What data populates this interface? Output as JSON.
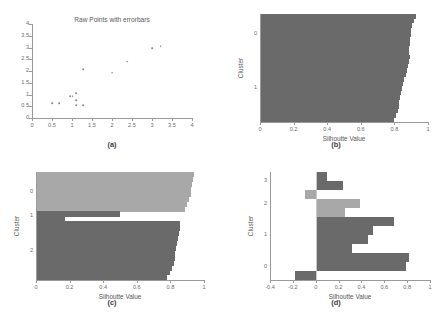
{
  "figure": {
    "panels": [
      "a",
      "b",
      "c",
      "d"
    ],
    "colors": {
      "dark_gray": "#6a6a6a",
      "light_gray": "#a8a8a8",
      "axis": "#9a9a9a",
      "text": "#5a5a5a",
      "background": "#ffffff"
    }
  },
  "panel_a": {
    "label": "(a)",
    "chart_data": {
      "type": "scatter",
      "title": "Raw Points with errorbars",
      "xlabel": "",
      "ylabel": "",
      "xlim": [
        0,
        4
      ],
      "ylim": [
        0,
        4
      ],
      "xticks": [
        "0",
        "0.5",
        "1",
        "1.5",
        "2",
        "2.5",
        "3",
        "3.5",
        "4"
      ],
      "xtick_values": [
        0,
        0.5,
        1,
        1.5,
        2,
        2.5,
        3,
        3.5,
        4
      ],
      "yticks": [
        "0",
        "0.5",
        "1",
        "1.5",
        "2",
        "2.5",
        "3",
        "3.5",
        "4"
      ],
      "ytick_values": [
        0,
        0.5,
        1,
        1.5,
        2,
        2.5,
        3,
        3.5,
        4
      ],
      "grid": false,
      "points": [
        {
          "x": 0.5,
          "y": 0.62
        },
        {
          "x": 0.68,
          "y": 0.62
        },
        {
          "x": 0.95,
          "y": 0.93
        },
        {
          "x": 1.02,
          "y": 0.93
        },
        {
          "x": 1.1,
          "y": 1.05
        },
        {
          "x": 1.1,
          "y": 0.75
        },
        {
          "x": 1.1,
          "y": 0.55
        },
        {
          "x": 1.28,
          "y": 0.55
        },
        {
          "x": 1.28,
          "y": 2.08
        },
        {
          "x": 2.0,
          "y": 1.93
        },
        {
          "x": 2.38,
          "y": 2.4
        },
        {
          "x": 3.0,
          "y": 2.97
        },
        {
          "x": 3.22,
          "y": 3.05
        }
      ]
    }
  },
  "panel_b": {
    "label": "(b)",
    "chart_data": {
      "type": "bar",
      "orientation": "horizontal",
      "title": "",
      "xlabel": "Silhoutte Value",
      "ylabel": "Cluster",
      "xlim": [
        0,
        1
      ],
      "xticks": [
        "0",
        "0.2",
        "0.4",
        "0.6",
        "0.8",
        "1"
      ],
      "xtick_values": [
        0,
        0.2,
        0.4,
        0.6,
        0.8,
        1
      ],
      "cluster_labels": [
        "0",
        "1"
      ],
      "cluster_label_positions": [
        0.8,
        0.35
      ],
      "grid": false,
      "clusters": [
        {
          "name": "0",
          "color": "#6a6a6a",
          "values": [
            0.93,
            0.915,
            0.905,
            0.9,
            0.9,
            0.895,
            0.89,
            0.885,
            0.885
          ],
          "starts": [
            0,
            0,
            0,
            0,
            0,
            0,
            0,
            0,
            0
          ]
        },
        {
          "name": "1",
          "color": "#6a6a6a",
          "values": [
            0.89,
            0.885,
            0.88,
            0.875,
            0.87,
            0.86,
            0.85,
            0.845,
            0.84,
            0.835,
            0.83,
            0.825,
            0.82,
            0.81,
            0.8
          ],
          "starts": [
            0,
            0,
            0,
            0,
            0,
            0,
            0,
            0,
            0,
            0,
            0,
            0,
            0,
            0,
            0
          ],
          "offset_start": 0.4
        }
      ]
    }
  },
  "panel_c": {
    "label": "(c)",
    "chart_data": {
      "type": "bar",
      "orientation": "horizontal",
      "title": "",
      "xlabel": "Silhoutte Value",
      "ylabel": "Cluster",
      "xlim": [
        0,
        1
      ],
      "xticks": [
        "0",
        "0.2",
        "0.4",
        "0.6",
        "0.8",
        "1"
      ],
      "xtick_values": [
        0,
        0.2,
        0.4,
        0.6,
        0.8,
        1
      ],
      "cluster_labels": [
        "0",
        "1",
        "2"
      ],
      "grid": false,
      "clusters": [
        {
          "name": "0",
          "color": "#a8a8a8",
          "values": [
            0.94,
            0.935,
            0.93,
            0.925,
            0.92,
            0.91,
            0.9,
            0.885
          ]
        },
        {
          "name": "1",
          "color": "#6a6a6a",
          "values": [
            0.5,
            0.17
          ]
        },
        {
          "name": "2",
          "color": "#6a6a6a",
          "values": [
            0.86,
            0.855,
            0.85,
            0.845,
            0.84,
            0.835,
            0.83,
            0.825,
            0.82,
            0.81,
            0.8,
            0.78
          ]
        }
      ]
    }
  },
  "panel_d": {
    "label": "(d)",
    "chart_data": {
      "type": "bar",
      "orientation": "horizontal",
      "title": "",
      "xlabel": "Silhoutte Value",
      "ylabel": "Cluster",
      "xlim": [
        -0.4,
        1
      ],
      "xticks": [
        "-0.4",
        "-0.2",
        "0",
        "0.2",
        "0.4",
        "0.6",
        "0.8",
        "1"
      ],
      "xtick_values": [
        -0.4,
        -0.2,
        0,
        0.2,
        0.4,
        0.6,
        0.8,
        1
      ],
      "cluster_labels": [
        "3",
        "2",
        "1",
        "0"
      ],
      "grid": false,
      "clusters": [
        {
          "name": "3",
          "color": "#6a6a6a",
          "values": [
            0.1,
            0.235
          ]
        },
        {
          "name": "2",
          "color": "#a8a8a8",
          "values": [
            -0.09,
            0.39,
            0.255
          ]
        },
        {
          "name": "1",
          "color": "#6a6a6a",
          "values": [
            0.685,
            0.5,
            0.455,
            0.32
          ]
        },
        {
          "name": "0",
          "color": "#6a6a6a",
          "values": [
            0.815,
            0.79,
            -0.18
          ]
        }
      ]
    }
  }
}
